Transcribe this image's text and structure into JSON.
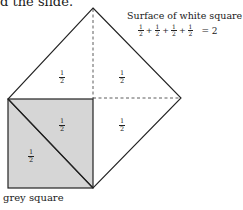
{
  "page": {
    "top_text": "d the slide."
  },
  "diagram": {
    "title": "Surface of white square",
    "equation": {
      "terms": [
        {
          "num": "1",
          "den": "2"
        },
        {
          "num": "1",
          "den": "2"
        },
        {
          "num": "1",
          "den": "2"
        },
        {
          "num": "1",
          "den": "2"
        }
      ],
      "operator": "+",
      "result": "= 2"
    },
    "region_labels": [
      {
        "num": "1",
        "den": "2",
        "region": "white-upper-left"
      },
      {
        "num": "1",
        "den": "2",
        "region": "white-upper-right"
      },
      {
        "num": "1",
        "den": "2",
        "region": "grey-upper-triangle"
      },
      {
        "num": "1",
        "den": "2",
        "region": "white-lower-right"
      },
      {
        "num": "1",
        "den": "2",
        "region": "grey-lower-triangle"
      }
    ],
    "grey_caption": "grey square",
    "colors": {
      "grey_fill": "#d6d6d6",
      "line": "#222222",
      "background": "#ffffff"
    }
  }
}
